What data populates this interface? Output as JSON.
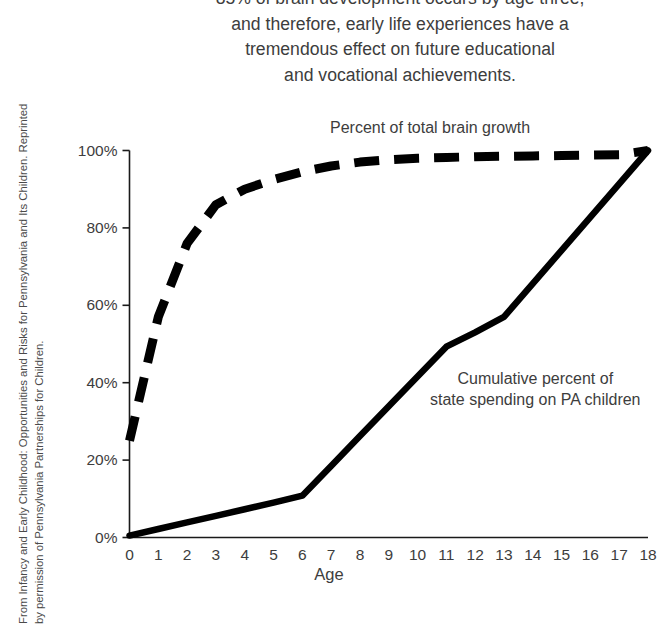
{
  "attribution": {
    "line1": "From Infancy and Early Childhood: Opportunities and Risks for Pennsylvania and Its Children. Reprinted",
    "line2": "by permission of Pennsylvania Partnerships for Children."
  },
  "title": {
    "line1": "85% of brain development occurs by age three,",
    "line2": "and therefore, early life experiences have a",
    "line3": "tremendous effect on future educational",
    "line4": "and vocational achievements."
  },
  "chart_data": {
    "type": "line",
    "title": "85% of brain development occurs by age three, and therefore, early life experiences have a tremendous effect on future educational and vocational achievements.",
    "xlabel": "Age",
    "ylabel": "",
    "xlim": [
      0,
      18
    ],
    "ylim": [
      0,
      100
    ],
    "grid": false,
    "legend_position": "inline-annotation",
    "x_ticks": [
      "0",
      "1",
      "2",
      "3",
      "4",
      "5",
      "6",
      "7",
      "8",
      "9",
      "10",
      "11",
      "12",
      "13",
      "14",
      "15",
      "16",
      "17",
      "18"
    ],
    "y_ticks": [
      "0%",
      "20%",
      "40%",
      "60%",
      "80%",
      "100%"
    ],
    "y_tick_values": [
      0,
      20,
      40,
      60,
      80,
      100
    ],
    "x": [
      0,
      1,
      2,
      3,
      4,
      5,
      6,
      7,
      8,
      9,
      10,
      11,
      12,
      13,
      14,
      15,
      16,
      17,
      18
    ],
    "series": [
      {
        "name": "Percent of total brain growth",
        "style": "dashed",
        "color": "#000000",
        "values": [
          25,
          57,
          76,
          86,
          90,
          92.5,
          94.5,
          96,
          97,
          97.6,
          98,
          98.2,
          98.4,
          98.5,
          98.6,
          98.7,
          98.8,
          98.9,
          100
        ]
      },
      {
        "name": "Cumulative percent of state spending on PA children",
        "style": "solid",
        "color": "#000000",
        "values": [
          0.5,
          2.2,
          3.9,
          5.6,
          7.3,
          9.0,
          10.8,
          18.5,
          26.2,
          33.9,
          41.6,
          49.3,
          53.0,
          57.0,
          65.6,
          74.2,
          82.8,
          91.4,
          100
        ]
      }
    ],
    "annotations": [
      {
        "text": "Percent of total brain growth",
        "series": "Percent of total brain growth"
      },
      {
        "text_line1": "Cumulative percent of",
        "text_line2": "state spending on PA children",
        "series": "Cumulative percent of state spending on PA children"
      }
    ],
    "axis_color": "#1a1a1a"
  }
}
